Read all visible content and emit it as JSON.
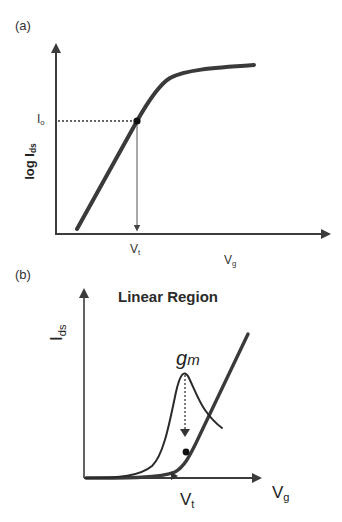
{
  "panels": [
    {
      "id": "a",
      "panel_label": "(a)",
      "y_axis_label": {
        "main": "log I",
        "sub": "ds"
      },
      "x_axis_label": {
        "main": "V",
        "sub": "g"
      },
      "marker_y_label": {
        "main": "I",
        "sub": "o"
      },
      "marker_x_label": {
        "main": "V",
        "sub": "t"
      }
    },
    {
      "id": "b",
      "panel_label": "(b)",
      "title": "Linear Region",
      "y_axis_label": {
        "main": "I",
        "sub": "ds"
      },
      "x_axis_label": {
        "main": "V",
        "sub": "g"
      },
      "marker_x_label": {
        "main": "V",
        "sub": "t"
      },
      "curve_label": {
        "main": "g",
        "sub": "m"
      }
    }
  ],
  "colors": {
    "curve": "#3a3a3a",
    "axis": "#3c3c3c",
    "guide": "#444444",
    "text": "#2a2a2a"
  }
}
